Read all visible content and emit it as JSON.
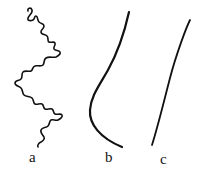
{
  "figure": {
    "width": 213,
    "height": 172,
    "background_color": "#ffffff",
    "ink_color": "#111111",
    "panels": [
      {
        "label": "a",
        "description": "highly tortuous fractal-like zigzag curve",
        "label_x": 29,
        "label_y": 150,
        "stroke_width": 1.6
      },
      {
        "label": "b",
        "description": "smooth S-shaped sigmoid curve",
        "label_x": 105,
        "label_y": 150,
        "stroke_width": 2.2
      },
      {
        "label": "c",
        "description": "nearly straight slanted line",
        "label_x": 160,
        "label_y": 152,
        "stroke_width": 1.8
      }
    ]
  },
  "chart_data": {
    "type": "line",
    "title": "",
    "subtitle": "",
    "xlabel": "",
    "ylabel": "",
    "grid": false,
    "legend": "none",
    "axis_visible": false,
    "xlim": [
      0,
      213
    ],
    "ylim": [
      172,
      0
    ],
    "annotations": [
      "a",
      "b",
      "c"
    ],
    "series": [
      {
        "name": "a",
        "style": "tortuous",
        "stroke": "#111111",
        "stroke_width": 1.6,
        "path": "M 28 11 C 27 8, 31 7, 32 10 C 33 13, 29 15, 28 18 C 27 21, 31 21, 33 20 C 35 19, 34 16, 36 16 C 38 16, 37 20, 39 22 C 41 24, 44 23, 44 26 C 44 29, 41 29, 41 32 C 41 35, 45 34, 47 36 C 49 38, 47 41, 49 42 C 51 43, 54 41, 55 43 C 56 45, 53 47, 54 49 C 55 51, 59 50, 60 52 C 61 54, 58 56, 56 57 C 53 58, 49 56, 46 58 C 43 60, 45 63, 43 65 C 41 67, 37 65, 35 66 C 32 67, 33 70, 31 71 C 29 72, 25 70, 23 72 C 21 74, 23 77, 21 79 C 19 81, 15 80, 15 83 C 15 86, 19 86, 21 88 C 23 90, 22 93, 24 95 C 26 97, 30 96, 32 98 C 34 100, 33 103, 35 104 C 37 105, 40 103, 42 104 C 44 105, 43 108, 45 109 C 47 110, 50 108, 52 109 C 54 110, 53 113, 55 114 C 57 115, 61 113, 62 115 C 63 117, 60 119, 58 120 C 56 121, 53 119, 51 120 C 49 121, 50 124, 48 126 C 46 128, 42 127, 41 130 C 40 133, 43 135, 44 137 C 45 139, 43 141, 41 142 C 39 143, 37 145, 38 147"
      },
      {
        "name": "b",
        "style": "smooth-sigmoid",
        "stroke": "#111111",
        "stroke_width": 2.2,
        "path": "M 129 12 C 125 30, 118 52, 108 70 C 99 86, 91 96, 90 110 C 89 124, 100 138, 122 147"
      },
      {
        "name": "c",
        "style": "straight",
        "stroke": "#111111",
        "stroke_width": 1.8,
        "path": "M 190 20 C 186 28, 176 55, 170 78 C 164 101, 158 126, 152 145"
      }
    ]
  },
  "labels": {
    "a": "a",
    "b": "b",
    "c": "c"
  }
}
